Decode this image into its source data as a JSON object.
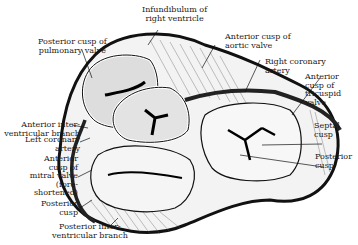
{
  "figure": {
    "labels": {
      "infundibulum": "Infundibulum of\nright ventricle",
      "posterior_cusp_pulmonary": "Posterior cusp of\npulmonary valve",
      "anterior_cusp_aortic": "Anterior cusp of\naortic valve",
      "right_coronary_artery": "Right coronary\nartery",
      "anterior_cusp_tricuspid": "Anterior\ncusp of\ntricuspid\nvalve",
      "septal_cusp": "Septal\ncusp",
      "posterior_cusp_tricuspid": "Posterior\ncusp",
      "anterior_interventricular_branch": "Anterior inter-\nventricular branch",
      "left_coronary_artery": "Left coronary\nartery",
      "anterior_cusp_mitral": "Anterior\ncusp of\nmitral valve\n(fore-\nshortened)",
      "posterior_cusp_mitral": "Posterior\ncusp",
      "posterior_interventricular_branch": "Posterior inter-\nventricular branch"
    }
  }
}
